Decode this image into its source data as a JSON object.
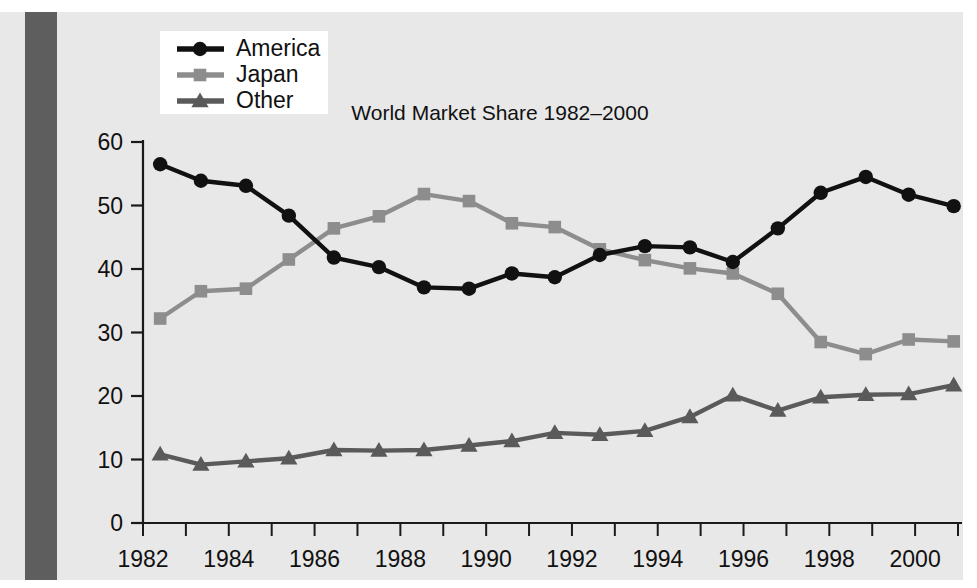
{
  "figure": {
    "background_color": "#e8e8e8",
    "page_color": "#ffffff",
    "binding_strip_color": "#5e5e5e"
  },
  "legend": {
    "position": "top-left",
    "background": "#ffffff",
    "entries": [
      {
        "label": "America",
        "color": "#111111",
        "marker": "circle"
      },
      {
        "label": "Japan",
        "color": "#8d8d8d",
        "marker": "square"
      },
      {
        "label": "Other",
        "color": "#5a5a5a",
        "marker": "triangle"
      }
    ]
  },
  "chart_data": {
    "type": "line",
    "title": "World Market Share 1982–2000",
    "xlabel": "",
    "ylabel": "",
    "grid": false,
    "legend_position": "top-left",
    "xlim": [
      1982,
      2001
    ],
    "ylim": [
      0,
      60
    ],
    "y_ticks": [
      0,
      10,
      20,
      30,
      40,
      50,
      60
    ],
    "y_tick_labels": [
      "0",
      "10",
      "20",
      "30",
      "40",
      "50",
      "60"
    ],
    "x_ticks": [
      1982,
      1983,
      1984,
      1985,
      1986,
      1987,
      1988,
      1989,
      1990,
      1991,
      1992,
      1993,
      1994,
      1995,
      1996,
      1997,
      1998,
      1999,
      2000,
      2001
    ],
    "x_tick_labels": [
      "1982",
      "",
      "1984",
      "",
      "1986",
      "",
      "1988",
      "",
      "1990",
      "",
      "1992",
      "",
      "1994",
      "",
      "1996",
      "",
      "1998",
      "",
      "2000",
      ""
    ],
    "x": [
      1982.4,
      1983.35,
      1984.4,
      1985.4,
      1986.45,
      1987.5,
      1988.55,
      1989.6,
      1990.6,
      1991.6,
      1992.65,
      1993.7,
      1994.75,
      1995.75,
      1996.8,
      1997.8,
      1998.85,
      1999.85,
      2000.9
    ],
    "series": [
      {
        "name": "America",
        "color": "#111111",
        "marker": "circle",
        "values": [
          56.5,
          53.9,
          53.1,
          48.4,
          41.8,
          40.3,
          37.1,
          36.9,
          39.3,
          38.7,
          42.2,
          43.6,
          43.4,
          41.1,
          46.4,
          52.0,
          54.5,
          51.7,
          49.9
        ]
      },
      {
        "name": "Japan",
        "color": "#8d8d8d",
        "marker": "square",
        "values": [
          32.2,
          36.5,
          36.9,
          41.5,
          46.4,
          48.3,
          51.8,
          50.7,
          47.2,
          46.6,
          43.1,
          41.4,
          40.1,
          39.3,
          36.1,
          28.5,
          26.6,
          28.9,
          28.6
        ]
      },
      {
        "name": "Other",
        "color": "#5a5a5a",
        "marker": "triangle",
        "values": [
          10.8,
          9.2,
          9.7,
          10.2,
          11.5,
          11.4,
          11.5,
          12.2,
          12.9,
          14.2,
          13.9,
          14.5,
          16.7,
          20.1,
          17.7,
          19.8,
          20.2,
          20.3,
          21.7
        ]
      }
    ]
  }
}
